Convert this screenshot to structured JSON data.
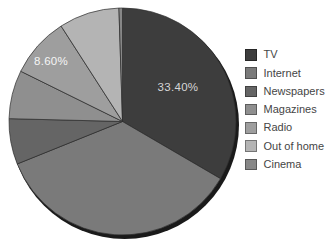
{
  "chart_data": {
    "type": "pie",
    "title": "",
    "legend_position": "right",
    "start_angle_deg": 0,
    "direction": "clockwise",
    "total": 100,
    "background_color": "#ffffff",
    "slice_border_color": "#2e2e2e",
    "shadow_color": "#1a1a1a",
    "legend_text_color": "#454545",
    "series": [
      {
        "name": "TV",
        "value": 33.4,
        "color": "#3d3d3d",
        "label": "33.40%",
        "label_x": 178,
        "label_y": 91,
        "label_color": "#d6d6d6"
      },
      {
        "name": "Internet",
        "value": 35.5,
        "color": "#7a7a7a",
        "label": "",
        "label_x": 0,
        "label_y": 0,
        "label_color": "#f2f2f2"
      },
      {
        "name": "Newspapers",
        "value": 6.5,
        "color": "#656565",
        "label": "",
        "label_x": 0,
        "label_y": 0,
        "label_color": "#f2f2f2"
      },
      {
        "name": "Magazines",
        "value": 6.9,
        "color": "#8f8f8f",
        "label": "",
        "label_x": 0,
        "label_y": 0,
        "label_color": "#f2f2f2"
      },
      {
        "name": "Radio",
        "value": 8.6,
        "color": "#9e9e9e",
        "label": "8.60%",
        "label_x": 51,
        "label_y": 65,
        "label_color": "#f5f5f5"
      },
      {
        "name": "Out of home",
        "value": 8.6,
        "color": "#b4b4b4",
        "label": "",
        "label_x": 0,
        "label_y": 0,
        "label_color": "#f2f2f2"
      },
      {
        "name": "Cinema",
        "value": 0.5,
        "color": "#878787",
        "label": "",
        "label_x": 0,
        "label_y": 0,
        "label_color": "#f2f2f2"
      }
    ]
  },
  "geometry_note": {}
}
